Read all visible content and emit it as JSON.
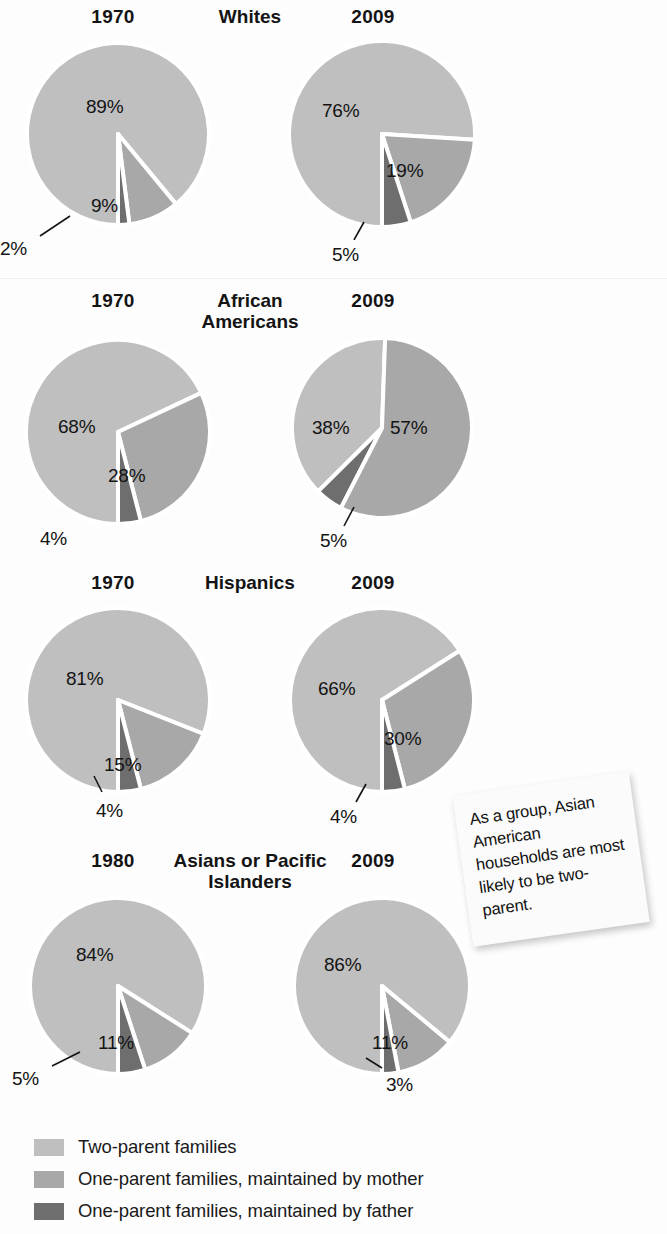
{
  "colors": {
    "two_parent": "#bfbfbf",
    "mother": "#a8a8a8",
    "father": "#6e6e6e",
    "separator": "#ffffff",
    "text": "#141414",
    "page_background": "#fdfdfd",
    "sticky_background": "#fbfbfb"
  },
  "legend": {
    "items": [
      {
        "label": "Two-parent families",
        "color": "#bfbfbf",
        "key": "two_parent"
      },
      {
        "label": "One-parent families, maintained by mother",
        "color": "#a8a8a8",
        "key": "mother"
      },
      {
        "label": "One-parent families, maintained by father",
        "color": "#6e6e6e",
        "key": "father"
      }
    ]
  },
  "callout": {
    "text": "As a group, Asian American households are most likely to be two-parent."
  },
  "groups": [
    {
      "title": "Whites",
      "left_year": "1970",
      "right_year": "2009",
      "left_labels": [
        "89%",
        "9%",
        "2%"
      ],
      "right_labels": [
        "76%",
        "19%",
        "5%"
      ]
    },
    {
      "title": "African Americans",
      "left_year": "1970",
      "right_year": "2009",
      "left_labels": [
        "68%",
        "28%",
        "4%"
      ],
      "right_labels": [
        "38%",
        "57%",
        "5%"
      ]
    },
    {
      "title": "Hispanics",
      "left_year": "1970",
      "right_year": "2009",
      "left_labels": [
        "81%",
        "15%",
        "4%"
      ],
      "right_labels": [
        "66%",
        "30%",
        "4%"
      ]
    },
    {
      "title": "Asians or Pacific Islanders",
      "left_year": "1980",
      "right_year": "2009",
      "left_labels": [
        "84%",
        "11%",
        "5%"
      ],
      "right_labels": [
        "86%",
        "11%",
        "3%"
      ]
    }
  ],
  "chart_data": {
    "type": "pie",
    "series_names": [
      "Two-parent families",
      "One-parent families, maintained by mother",
      "One-parent families, maintained by father"
    ],
    "series_colors": [
      "#bfbfbf",
      "#a8a8a8",
      "#6e6e6e"
    ],
    "legend_position": "bottom-left",
    "annotation": "As a group, Asian American households are most likely to be two-parent.",
    "charts": [
      {
        "group": "Whites",
        "year": "1970",
        "labels": [
          "Two-parent families",
          "One-parent families, maintained by mother",
          "One-parent families, maintained by father"
        ],
        "values": [
          89,
          9,
          2
        ],
        "value_labels": [
          "89%",
          "9%",
          "2%"
        ]
      },
      {
        "group": "Whites",
        "year": "2009",
        "labels": [
          "Two-parent families",
          "One-parent families, maintained by mother",
          "One-parent families, maintained by father"
        ],
        "values": [
          76,
          19,
          5
        ],
        "value_labels": [
          "76%",
          "19%",
          "5%"
        ]
      },
      {
        "group": "African Americans",
        "year": "1970",
        "labels": [
          "Two-parent families",
          "One-parent families, maintained by mother",
          "One-parent families, maintained by father"
        ],
        "values": [
          68,
          28,
          4
        ],
        "value_labels": [
          "68%",
          "28%",
          "4%"
        ]
      },
      {
        "group": "African Americans",
        "year": "2009",
        "labels": [
          "Two-parent families",
          "One-parent families, maintained by mother",
          "One-parent families, maintained by father"
        ],
        "values": [
          38,
          57,
          5
        ],
        "value_labels": [
          "38%",
          "57%",
          "5%"
        ]
      },
      {
        "group": "Hispanics",
        "year": "1970",
        "labels": [
          "Two-parent families",
          "One-parent families, maintained by mother",
          "One-parent families, maintained by father"
        ],
        "values": [
          81,
          15,
          4
        ],
        "value_labels": [
          "81%",
          "15%",
          "4%"
        ]
      },
      {
        "group": "Hispanics",
        "year": "2009",
        "labels": [
          "Two-parent families",
          "One-parent families, maintained by mother",
          "One-parent families, maintained by father"
        ],
        "values": [
          66,
          30,
          4
        ],
        "value_labels": [
          "66%",
          "30%",
          "4%"
        ]
      },
      {
        "group": "Asians or Pacific Islanders",
        "year": "1980",
        "labels": [
          "Two-parent families",
          "One-parent families, maintained by mother",
          "One-parent families, maintained by father"
        ],
        "values": [
          84,
          11,
          5
        ],
        "value_labels": [
          "84%",
          "11%",
          "5%"
        ]
      },
      {
        "group": "Asians or Pacific Islanders",
        "year": "2009",
        "labels": [
          "Two-parent families",
          "One-parent families, maintained by mother",
          "One-parent families, maintained by father"
        ],
        "values": [
          86,
          11,
          3
        ],
        "value_labels": [
          "86%",
          "11%",
          "3%"
        ]
      }
    ]
  }
}
